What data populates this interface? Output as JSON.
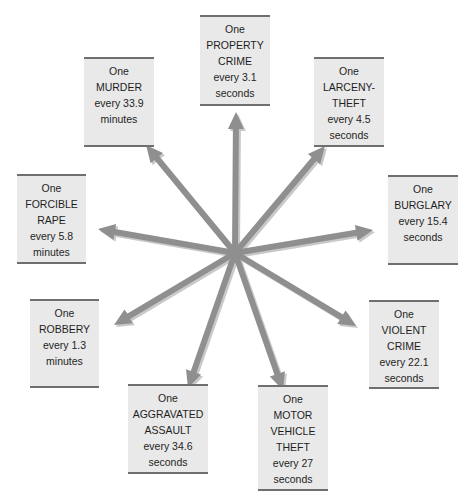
{
  "diagram": {
    "type": "crime-clock",
    "center": {
      "x": 235,
      "y": 253
    },
    "arrow_color": "#8f8f8f",
    "arrow_shadow_color": "#c9c9c9",
    "box_fill": "#e9e9e9",
    "box_rule_color": "#6f6f6f"
  },
  "boxes": [
    {
      "id": "property-crime",
      "lines": [
        "One",
        "PROPERTY",
        "CRIME",
        "every 3.1",
        "seconds"
      ],
      "crime": "Property crime",
      "interval": "3.1",
      "unit": "seconds",
      "rect": [
        200,
        15,
        70,
        91
      ],
      "arrow_tip": [
        236,
        112
      ]
    },
    {
      "id": "murder",
      "lines": [
        "One",
        "MURDER",
        "every 33.9",
        "minutes"
      ],
      "crime": "Murder",
      "interval": "33.9",
      "unit": "minutes",
      "rect": [
        84,
        57,
        70,
        90
      ],
      "arrow_tip": [
        146,
        145
      ]
    },
    {
      "id": "larceny-theft",
      "lines": [
        "One",
        "LARCENY-",
        "THEFT",
        "every 4.5",
        "seconds"
      ],
      "crime": "Larceny-theft",
      "interval": "4.5",
      "unit": "seconds",
      "rect": [
        314,
        57,
        70,
        90
      ],
      "arrow_tip": [
        325,
        146
      ]
    },
    {
      "id": "forcible-rape",
      "lines": [
        "One",
        "FORCIBLE",
        "RAPE",
        "every 5.8",
        "minutes"
      ],
      "crime": "Forcible rape",
      "interval": "5.8",
      "unit": "minutes",
      "rect": [
        17,
        174,
        69,
        90
      ],
      "arrow_tip": [
        98,
        229
      ]
    },
    {
      "id": "burglary",
      "lines": [
        "One",
        "BURGLARY",
        "every 15.4",
        "seconds"
      ],
      "crime": "Burglary",
      "interval": "15.4",
      "unit": "seconds",
      "rect": [
        388,
        175,
        70,
        90
      ],
      "arrow_tip": [
        373,
        230
      ]
    },
    {
      "id": "robbery",
      "lines": [
        "One",
        "ROBBERY",
        "every 1.3",
        "minutes"
      ],
      "crime": "Robbery",
      "interval": "1.3",
      "unit": "minutes",
      "rect": [
        30,
        299,
        69,
        89
      ],
      "arrow_tip": [
        114,
        325
      ]
    },
    {
      "id": "violent-crime",
      "lines": [
        "One",
        "VIOLENT",
        "CRIME",
        "every 22.1",
        "seconds"
      ],
      "crime": "Violent crime",
      "interval": "22.1",
      "unit": "seconds",
      "rect": [
        369,
        300,
        70,
        89
      ],
      "arrow_tip": [
        356,
        326
      ]
    },
    {
      "id": "aggravated-assault",
      "lines": [
        "One",
        "AGGRAVATED",
        "ASSAULT",
        "every 34.6",
        "seconds"
      ],
      "crime": "Aggravated assault",
      "interval": "34.6",
      "unit": "seconds",
      "rect": [
        128,
        384,
        80,
        90
      ],
      "arrow_tip": [
        188,
        388
      ]
    },
    {
      "id": "motor-vehicle-theft",
      "lines": [
        "One",
        "MOTOR",
        "VEHICLE",
        "THEFT",
        "every 27",
        "seconds"
      ],
      "crime": "Motor vehicle theft",
      "interval": "27",
      "unit": "seconds",
      "rect": [
        258,
        385,
        70,
        106
      ],
      "arrow_tip": [
        283,
        390
      ]
    }
  ]
}
